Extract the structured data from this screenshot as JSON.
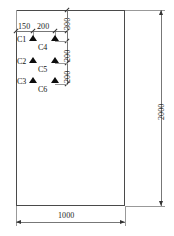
{
  "drawing": {
    "title": "Slab plan with sensor layout",
    "outline": {
      "width_label": "1000",
      "height_label": "2000"
    },
    "overall_dimensions": [
      {
        "name": "width",
        "value": "1000",
        "orientation": "horizontal",
        "position": "bottom"
      },
      {
        "name": "height",
        "value": "2000",
        "orientation": "vertical",
        "position": "right"
      }
    ],
    "horizontal_chain": {
      "orientation": "horizontal",
      "position": "top",
      "segments": [
        "150",
        "200",
        "300"
      ]
    },
    "vertical_chain": {
      "orientation": "vertical",
      "position": "inner-right",
      "segments": [
        "300",
        "200",
        "200"
      ]
    },
    "sensors": [
      {
        "id": "C1",
        "label": "C1",
        "column": "left",
        "row": 1,
        "marker": "triangle-marker"
      },
      {
        "id": "C4",
        "label": "C4",
        "column": "right",
        "row": 1,
        "marker": "triangle-marker"
      },
      {
        "id": "C2",
        "label": "C2",
        "column": "left",
        "row": 2,
        "marker": "triangle-marker"
      },
      {
        "id": "C5",
        "label": "C5",
        "column": "right",
        "row": 2,
        "marker": "triangle-marker"
      },
      {
        "id": "C3",
        "label": "C3",
        "column": "left",
        "row": 3,
        "marker": "triangle-marker"
      },
      {
        "id": "C6",
        "label": "C6",
        "column": "right",
        "row": 3,
        "marker": "triangle-marker"
      }
    ],
    "colors": {
      "outline": "#4a4a4a",
      "dimension_line": "#777777",
      "extension_line": "#999999",
      "marker": "#0d0d0d",
      "text": "#1a1a1a",
      "background": "#ffffff"
    }
  }
}
